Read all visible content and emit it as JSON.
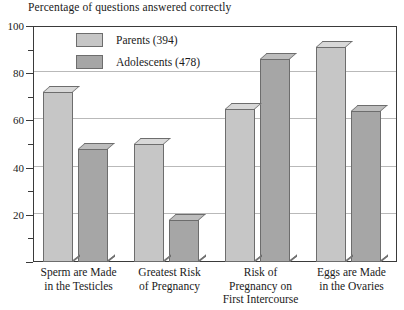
{
  "chart_data": {
    "type": "bar",
    "title": "Percentage of questions answered correctly",
    "xlabel": "",
    "ylabel": "",
    "ylim": [
      0,
      100
    ],
    "y_ticks_major": [
      0,
      20,
      40,
      60,
      80,
      100
    ],
    "y_ticks_minor": [
      10,
      30,
      50,
      70,
      90
    ],
    "y_tick_labels": [
      "20",
      "40",
      "60",
      "80",
      "100"
    ],
    "grid": "horizontal",
    "legend_position": "top-left-inside",
    "categories": [
      "Sperm are Made in the Testicles",
      "Greatest Risk of Pregnancy",
      "Risk of Pregnancy on First Intercourse",
      "Eggs are Made in the Ovaries"
    ],
    "category_lines": [
      [
        "Sperm are Made",
        "in the Testicles"
      ],
      [
        "Greatest Risk",
        "of Pregnancy"
      ],
      [
        "Risk of",
        "Pregnancy on",
        "First Intercourse"
      ],
      [
        "Eggs are Made",
        "in the Ovaries"
      ]
    ],
    "series": [
      {
        "name": "Parents (394)",
        "key": "parents",
        "color": "#c6c6c6",
        "values": [
          72,
          50,
          65,
          91
        ]
      },
      {
        "name": "Adolescents (478)",
        "key": "adolescents",
        "color": "#a6a6a6",
        "values": [
          48,
          18,
          86,
          64
        ]
      }
    ]
  },
  "legend": {
    "items": [
      {
        "label": "Parents (394)",
        "key": "parents"
      },
      {
        "label": "Adolescents (478)",
        "key": "adolescents"
      }
    ]
  },
  "colors": {
    "parents_face": "#c6c6c6",
    "adolescents_face": "#a6a6a6",
    "frame": "#3a3a3a",
    "gridline": "#b9b9b9",
    "background": "#ffffff",
    "text": "#1a1a1a"
  }
}
